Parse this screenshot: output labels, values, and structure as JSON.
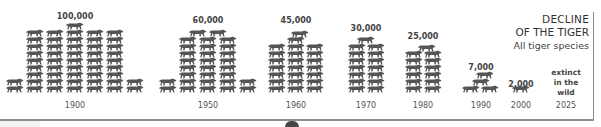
{
  "title": {
    "line1": "DECLINE",
    "line2": "OF THE TIGER",
    "subtitle": "All tiger species"
  },
  "colors": {
    "tiger": "#555555",
    "frame": "#8a8a8a",
    "text": "#333333"
  },
  "extinct_label": [
    "extinct",
    "in the",
    "wild"
  ],
  "chart_data": {
    "type": "bar",
    "title": "DECLINE OF THE TIGER",
    "subtitle": "All tiger species",
    "xlabel": "",
    "ylabel": "",
    "style": "pictogram (tiger icons)",
    "categories": [
      "1900",
      "1950",
      "1960",
      "1970",
      "1980",
      "1990",
      "2000",
      "2025"
    ],
    "values": [
      100000,
      60000,
      45000,
      30000,
      25000,
      7000,
      2000,
      0
    ],
    "value_labels": [
      "100,000",
      "60,000",
      "45,000",
      "30,000",
      "25,000",
      "7,000",
      "2,000",
      "extinct in the wild"
    ],
    "grid": false,
    "legend": "none"
  },
  "groups": [
    {
      "year": "1900",
      "label": "100,000",
      "cx": 75,
      "labelTop": 12
    },
    {
      "year": "1950",
      "label": "60,000",
      "cx": 208,
      "labelTop": 16
    },
    {
      "year": "1960",
      "label": "45,000",
      "cx": 296,
      "labelTop": 16
    },
    {
      "year": "1970",
      "label": "30,000",
      "cx": 366,
      "labelTop": 24
    },
    {
      "year": "1980",
      "label": "25,000",
      "cx": 423,
      "labelTop": 32
    },
    {
      "year": "1990",
      "label": "7,000",
      "cx": 481,
      "labelTop": 63
    },
    {
      "year": "2000",
      "label": "2,000",
      "cx": 521,
      "labelTop": 80
    },
    {
      "year": "2025",
      "label": "",
      "cx": 566,
      "labelTop": 0
    }
  ]
}
